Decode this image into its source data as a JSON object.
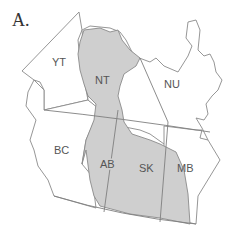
{
  "panel": {
    "label": "A."
  },
  "map": {
    "colors": {
      "shaded": "#cfcfcf",
      "unshaded": "#ffffff",
      "border": "#8a8a8a",
      "label": "#555555"
    },
    "regions": [
      {
        "code": "YT",
        "shaded": false
      },
      {
        "code": "NT",
        "shaded": true
      },
      {
        "code": "NU",
        "shaded": false
      },
      {
        "code": "BC",
        "shaded": false
      },
      {
        "code": "AB",
        "shaded": true
      },
      {
        "code": "SK",
        "shaded": true
      },
      {
        "code": "MB",
        "shaded": true
      }
    ],
    "labels": {
      "yt": "YT",
      "nt": "NT",
      "nu": "NU",
      "bc": "BC",
      "ab": "AB",
      "sk": "SK",
      "mb": "MB"
    }
  }
}
